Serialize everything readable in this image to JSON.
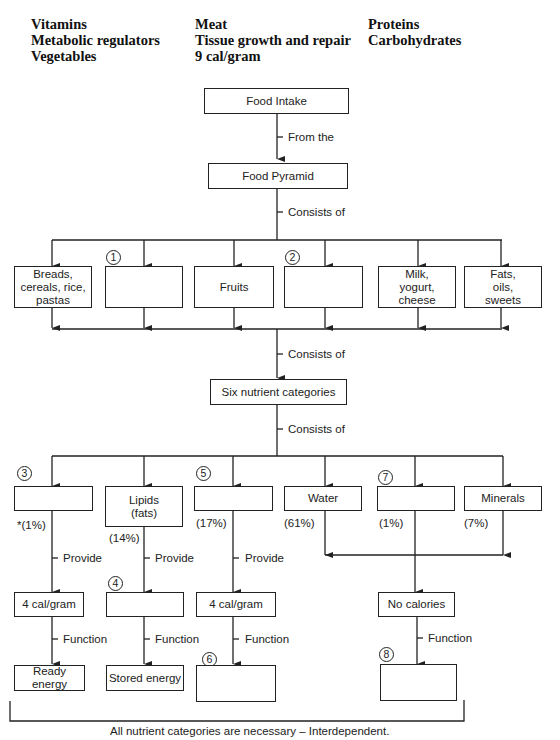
{
  "word_bank": {
    "columns": [
      [
        "Vitamins",
        "Metabolic regulators",
        "Vegetables"
      ],
      [
        "Meat",
        "Tissue growth and repair",
        "9 cal/gram"
      ],
      [
        "Proteins",
        "Carbohydrates"
      ]
    ]
  },
  "top": {
    "food_intake": "Food Intake",
    "from_the": "From the",
    "food_pyramid": "Food Pyramid",
    "consists_of_1": "Consists of"
  },
  "food_groups": [
    {
      "label": "Breads,\ncereals, rice,\npastas",
      "number": ""
    },
    {
      "label": "",
      "number": "1"
    },
    {
      "label": "Fruits",
      "number": ""
    },
    {
      "label": "",
      "number": "2"
    },
    {
      "label": "Milk,\nyogurt,\ncheese",
      "number": ""
    },
    {
      "label": "Fats,\noils,\nsweets",
      "number": ""
    }
  ],
  "middle": {
    "consists_of_2": "Consists of",
    "six_nutrients": "Six nutrient categories",
    "consists_of_3": "Consists of"
  },
  "nutrients": [
    {
      "label": "",
      "number": "3",
      "percent": "*(1%)"
    },
    {
      "label": "Lipids\n(fats)",
      "number": "",
      "percent": "(14%)"
    },
    {
      "label": "",
      "number": "5",
      "percent": "(17%)"
    },
    {
      "label": "Water",
      "number": "",
      "percent": "(61%)"
    },
    {
      "label": "",
      "number": "7",
      "percent": "(1%)"
    },
    {
      "label": "Minerals",
      "number": "",
      "percent": "(7%)"
    }
  ],
  "provide_label": "Provide",
  "function_label": "Function",
  "calories": [
    {
      "label": "4 cal/gram",
      "number": ""
    },
    {
      "label": "",
      "number": "4"
    },
    {
      "label": "4 cal/gram",
      "number": ""
    },
    {
      "label": "No calories",
      "number": ""
    }
  ],
  "functions": [
    {
      "label": "Ready energy",
      "number": ""
    },
    {
      "label": "Stored energy",
      "number": ""
    },
    {
      "label": "",
      "number": "6"
    },
    {
      "label": "",
      "number": "8"
    }
  ],
  "footer": "All nutrient categories are necessary – Interdependent."
}
